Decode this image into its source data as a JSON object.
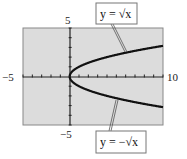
{
  "chart_data": {
    "type": "line",
    "title": "",
    "xlabel": "",
    "ylabel": "",
    "xlim": [
      -5,
      10
    ],
    "ylim": [
      -5,
      5
    ],
    "grid": false,
    "x_tick_step": 1,
    "y_tick_step": 1,
    "tick_labels": {
      "x_min": "−5",
      "x_max": "10",
      "y_max": "5",
      "y_min": "−5"
    },
    "series": [
      {
        "name": "y = √x",
        "function": "sqrt(x)",
        "x": [
          0,
          0.25,
          1,
          2,
          3,
          4,
          5,
          6,
          7,
          8,
          9,
          10
        ],
        "values": [
          0,
          0.5,
          1,
          1.41,
          1.73,
          2,
          2.24,
          2.45,
          2.65,
          2.83,
          3,
          3.16
        ]
      },
      {
        "name": "y = −√x",
        "function": "-sqrt(x)",
        "x": [
          0,
          0.25,
          1,
          2,
          3,
          4,
          5,
          6,
          7,
          8,
          9,
          10
        ],
        "values": [
          0,
          -0.5,
          -1,
          -1.41,
          -1.73,
          -2,
          -2.24,
          -2.45,
          -2.65,
          -2.83,
          -3,
          -3.16
        ]
      }
    ],
    "annotations": [
      {
        "text": "y = √x",
        "position": "top-right callout",
        "points_to": "upper curve"
      },
      {
        "text": "y = −√x",
        "position": "bottom-right callout",
        "points_to": "lower curve"
      }
    ],
    "colors": {
      "plot_background": "#dcdcdc",
      "curve": "#111111",
      "axis": "#222222",
      "frame": "#888888"
    }
  }
}
